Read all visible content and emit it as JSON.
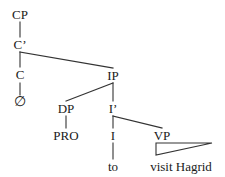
{
  "figure": {
    "kind": "syntax-tree-diagram",
    "sentence": "to visit Hagrid",
    "background_color": "#ffffff",
    "line_color": "#333333",
    "text_color": "#1a1a1a"
  },
  "nodes": {
    "cp": {
      "label": "CP",
      "x": 20,
      "y": 18
    },
    "cbar": {
      "label": "C’",
      "x": 20,
      "y": 48
    },
    "c": {
      "label": "C",
      "x": 20,
      "y": 78
    },
    "null": {
      "label": "∅",
      "x": 20,
      "y": 105
    },
    "ip": {
      "label": "IP",
      "x": 113,
      "y": 79
    },
    "dp": {
      "label": "DP",
      "x": 66,
      "y": 112
    },
    "pro": {
      "label": "PRO",
      "x": 66,
      "y": 139
    },
    "ibar": {
      "label": "I’",
      "x": 113,
      "y": 112
    },
    "i": {
      "label": "I",
      "x": 113,
      "y": 139
    },
    "to": {
      "label": "to",
      "x": 113,
      "y": 170
    },
    "vp": {
      "label": "VP",
      "x": 162,
      "y": 139
    },
    "vp_phrase": {
      "label": "visit Hagrid",
      "x": 181,
      "y": 170
    }
  },
  "edges": [
    {
      "name": "cp-to-cbar",
      "from": "CP",
      "to": "C’",
      "type": "line"
    },
    {
      "name": "cbar-to-c",
      "from": "C’",
      "to": "C",
      "type": "line"
    },
    {
      "name": "cbar-to-ip",
      "from": "C’",
      "to": "IP",
      "type": "line"
    },
    {
      "name": "c-to-null",
      "from": "C",
      "to": "∅",
      "type": "line"
    },
    {
      "name": "ip-to-dp",
      "from": "IP",
      "to": "DP",
      "type": "line"
    },
    {
      "name": "ip-to-ibar",
      "from": "IP",
      "to": "I’",
      "type": "line"
    },
    {
      "name": "dp-to-pro",
      "from": "DP",
      "to": "PRO",
      "type": "line"
    },
    {
      "name": "ibar-to-i",
      "from": "I’",
      "to": "I",
      "type": "line"
    },
    {
      "name": "ibar-to-vp",
      "from": "I’",
      "to": "VP",
      "type": "line"
    },
    {
      "name": "i-to-to",
      "from": "I",
      "to": "to",
      "type": "line"
    },
    {
      "name": "vp-to-phrase",
      "from": "VP",
      "to": "visit Hagrid",
      "type": "triangle"
    }
  ]
}
